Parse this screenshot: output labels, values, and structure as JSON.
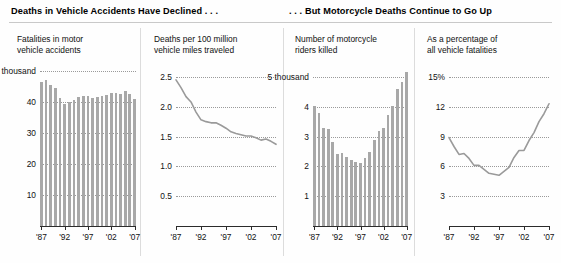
{
  "headers": {
    "left": "Deaths in Vehicle Accidents Have Declined . . .",
    "right": ". . . But Motorcycle Deaths Continue to Go Up"
  },
  "xaxis": {
    "tick_labels": [
      "'87",
      "'92",
      "'97",
      "'02",
      "'07"
    ],
    "start_year": 1987,
    "end_year": 2007
  },
  "chart_data": [
    {
      "id": "fatalities-motor-vehicle",
      "type": "bar",
      "title": "Fatalities in motor\nvehicle accidents",
      "xlabel": "",
      "ylabel": "",
      "ylim": [
        0,
        52
      ],
      "grid": true,
      "ytick_labels": [
        "50 thousand",
        "40",
        "30",
        "20",
        "10"
      ],
      "yticks": [
        50,
        40,
        30,
        20,
        10
      ],
      "categories": [
        "'87",
        "'88",
        "'89",
        "'90",
        "'91",
        "'92",
        "'93",
        "'94",
        "'95",
        "'96",
        "'97",
        "'98",
        "'99",
        "'00",
        "'01",
        "'02",
        "'03",
        "'04",
        "'05",
        "'06",
        "'07"
      ],
      "values": [
        46.4,
        47.1,
        45.6,
        44.6,
        41.5,
        39.3,
        40.2,
        40.7,
        41.8,
        42.1,
        42.0,
        41.5,
        41.7,
        41.9,
        42.2,
        43.0,
        42.9,
        42.8,
        43.5,
        42.7,
        41.1
      ]
    },
    {
      "id": "deaths-per-100m-vmt",
      "type": "line",
      "title": "Deaths per 100 million\nvehicle miles traveled",
      "xlabel": "",
      "ylabel": "",
      "ylim": [
        0,
        2.7
      ],
      "grid": true,
      "ytick_labels": [
        "2.5",
        "2.0",
        "1.5",
        "1.0",
        "0.5"
      ],
      "yticks": [
        2.5,
        2.0,
        1.5,
        1.0,
        0.5
      ],
      "x": [
        "'87",
        "'88",
        "'89",
        "'90",
        "'91",
        "'92",
        "'93",
        "'94",
        "'95",
        "'96",
        "'97",
        "'98",
        "'99",
        "'00",
        "'01",
        "'02",
        "'03",
        "'04",
        "'05",
        "'06",
        "'07"
      ],
      "values": [
        2.45,
        2.32,
        2.17,
        2.08,
        1.91,
        1.78,
        1.75,
        1.73,
        1.73,
        1.69,
        1.64,
        1.58,
        1.55,
        1.53,
        1.51,
        1.51,
        1.48,
        1.44,
        1.46,
        1.42,
        1.37
      ]
    },
    {
      "id": "motorcycle-riders-killed",
      "type": "bar",
      "title": "Number of motorcycle\nriders killed",
      "xlabel": "",
      "ylabel": "",
      "ylim": [
        0,
        5.4
      ],
      "grid": true,
      "ytick_labels": [
        "5 thousand",
        "4",
        "3",
        "2",
        "1"
      ],
      "yticks": [
        5,
        4,
        3,
        2,
        1
      ],
      "categories": [
        "'87",
        "'88",
        "'89",
        "'90",
        "'91",
        "'92",
        "'93",
        "'94",
        "'95",
        "'96",
        "'97",
        "'98",
        "'99",
        "'00",
        "'01",
        "'02",
        "'03",
        "'04",
        "'05",
        "'06",
        "'07"
      ],
      "values": [
        4.04,
        3.78,
        3.3,
        3.24,
        2.81,
        2.4,
        2.45,
        2.32,
        2.23,
        2.16,
        2.12,
        2.29,
        2.48,
        2.9,
        3.2,
        3.28,
        3.71,
        4.03,
        4.58,
        4.84,
        5.15
      ]
    },
    {
      "id": "percentage-all-vehicle-fatalities",
      "type": "line",
      "title": "As a percentage of\nall vehicle fatalities",
      "xlabel": "",
      "ylabel": "",
      "ylim": [
        0,
        16.2
      ],
      "grid": true,
      "ytick_labels": [
        "15%",
        "12",
        "9",
        "6",
        "3"
      ],
      "yticks": [
        15,
        12,
        9,
        6,
        3
      ],
      "x": [
        "'87",
        "'88",
        "'89",
        "'90",
        "'91",
        "'92",
        "'93",
        "'94",
        "'95",
        "'96",
        "'97",
        "'98",
        "'99",
        "'00",
        "'01",
        "'02",
        "'03",
        "'04",
        "'05",
        "'06",
        "'07"
      ],
      "values": [
        8.9,
        8.0,
        7.2,
        7.3,
        6.8,
        6.1,
        6.1,
        5.7,
        5.3,
        5.2,
        5.1,
        5.5,
        5.9,
        6.9,
        7.6,
        7.6,
        8.6,
        9.4,
        10.5,
        11.3,
        12.3
      ]
    }
  ],
  "style": {
    "bar_color": "#a8a8a8",
    "line_color": "#9a9a9a",
    "grid_color": "#9a9a9a",
    "axis_color": "#2b2b2b",
    "text_color": "#111111",
    "background": "#fefefe"
  }
}
